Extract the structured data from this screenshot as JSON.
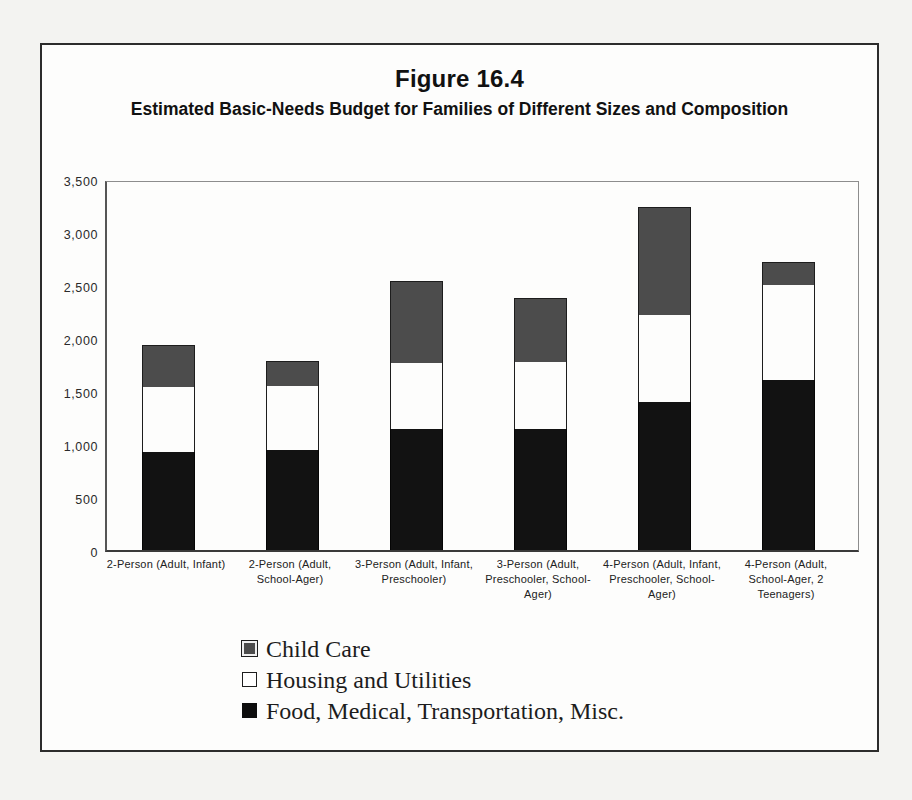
{
  "figure": {
    "number_label": "Figure 16.4",
    "subtitle": "Estimated Basic-Needs Budget for Families of Different Sizes and Composition"
  },
  "axis": {
    "y_ticks": [
      "3,500",
      "3,000",
      "2,500",
      "2,000",
      "1,500",
      "1,000",
      "500",
      "0"
    ]
  },
  "legend": {
    "items": [
      {
        "label": "Child Care",
        "color": "#4c4c4c",
        "swatch": "childcare-swatch"
      },
      {
        "label": "Housing and Utilities",
        "color": "#ffffff",
        "swatch": "housing-swatch"
      },
      {
        "label": "Food, Medical, Transportation, Misc.",
        "color": "#0d0d0d",
        "swatch": "food-swatch"
      }
    ]
  },
  "categories": [
    "2-Person (Adult, Infant)",
    "2-Person (Adult, School-Ager)",
    "3-Person (Adult, Infant, Preschooler)",
    "3-Person (Adult, Preschooler, School-Ager)",
    "4-Person (Adult, Infant, Preschooler, School-Ager)",
    "4-Person (Adult, School-Ager, 2 Teenagers)"
  ],
  "chart_data": {
    "type": "bar",
    "stacked": true,
    "title": "Estimated Basic-Needs Budget for Families of Different Sizes and Composition",
    "xlabel": "",
    "ylabel": "",
    "ylim": [
      0,
      3500
    ],
    "ytick_step": 500,
    "grid": false,
    "legend_position": "bottom",
    "categories": [
      "2-Person (Adult, Infant)",
      "2-Person (Adult, School-Ager)",
      "3-Person (Adult, Infant, Preschooler)",
      "3-Person (Adult, Preschooler, School-Ager)",
      "4-Person (Adult, Infant, Preschooler, School-Ager)",
      "4-Person (Adult, School-Ager, 2 Teenagers)"
    ],
    "series": [
      {
        "name": "Food, Medical, Transportation, Misc.",
        "color": "#0d0d0d",
        "values": [
          925,
          945,
          1140,
          1140,
          1395,
          1600
        ]
      },
      {
        "name": "Housing and Utilities",
        "color": "#ffffff",
        "values": [
          610,
          600,
          625,
          635,
          825,
          900
        ]
      },
      {
        "name": "Child Care",
        "color": "#4c4c4c",
        "values": [
          395,
          235,
          770,
          600,
          1020,
          215
        ]
      }
    ],
    "totals": [
      1930,
      1780,
      2535,
      2375,
      3240,
      2715
    ]
  }
}
